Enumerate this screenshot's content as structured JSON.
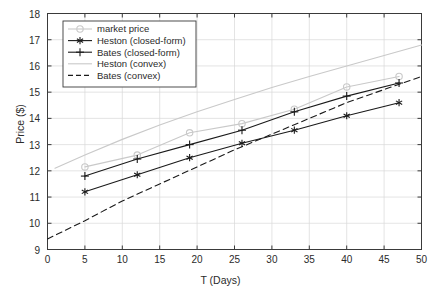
{
  "chart_data": {
    "type": "line",
    "title": "",
    "xlabel": "T (Days)",
    "ylabel": "Price ($)",
    "xlim": [
      0,
      50
    ],
    "ylim": [
      9,
      18
    ],
    "xticks": [
      0,
      5,
      10,
      15,
      20,
      25,
      30,
      35,
      40,
      45,
      50
    ],
    "yticks": [
      9,
      10,
      11,
      12,
      13,
      14,
      15,
      16,
      17,
      18
    ],
    "grid": true,
    "legend_position": "upper-left",
    "x": [
      5,
      12,
      19,
      26,
      33,
      40,
      47
    ],
    "series": [
      {
        "name": "market price",
        "label": "market price",
        "color": "#c9c9c9",
        "marker": "circle",
        "linestyle": "solid",
        "values": [
          12.15,
          12.6,
          13.45,
          13.8,
          14.35,
          15.2,
          15.6
        ]
      },
      {
        "name": "Heston (closed-form)",
        "label": "Heston (closed-form)",
        "color": "#1a1a1a",
        "marker": "asterisk",
        "linestyle": "solid",
        "values": [
          11.2,
          11.85,
          12.5,
          13.05,
          13.55,
          14.1,
          14.6
        ]
      },
      {
        "name": "Bates (closed-form)",
        "label": "Bates (closed-form)",
        "color": "#1a1a1a",
        "marker": "plus",
        "linestyle": "solid",
        "values": [
          11.8,
          12.45,
          13.0,
          13.55,
          14.25,
          14.85,
          15.35
        ]
      },
      {
        "name": "Heston (convex)",
        "label": "Heston (convex)",
        "color": "#c9c9c9",
        "marker": "none",
        "linestyle": "solid",
        "x": [
          1,
          5,
          10,
          15,
          20,
          25,
          30,
          35,
          40,
          45,
          50
        ],
        "values": [
          12.1,
          12.6,
          13.2,
          13.75,
          14.25,
          14.72,
          15.18,
          15.6,
          16.0,
          16.4,
          16.8
        ]
      },
      {
        "name": "Bates (convex)",
        "label": "Bates (convex)",
        "color": "#1a1a1a",
        "marker": "none",
        "linestyle": "dashed",
        "x": [
          0,
          5,
          10,
          15,
          20,
          25,
          30,
          35,
          40,
          45,
          50
        ],
        "values": [
          9.4,
          10.1,
          10.85,
          11.5,
          12.15,
          12.8,
          13.4,
          14.0,
          14.6,
          15.1,
          15.6
        ]
      }
    ]
  },
  "legend": {
    "items": [
      {
        "label": "market price"
      },
      {
        "label": "Heston (closed-form)"
      },
      {
        "label": "Bates (closed-form)"
      },
      {
        "label": "Heston (convex)"
      },
      {
        "label": "Bates (convex)"
      }
    ]
  },
  "axes": {
    "xlabel": "T (Days)",
    "ylabel": "Price ($)",
    "xticklabels": [
      "0",
      "5",
      "10",
      "15",
      "20",
      "25",
      "30",
      "35",
      "40",
      "45",
      "50"
    ],
    "yticklabels": [
      "9",
      "10",
      "11",
      "12",
      "13",
      "14",
      "15",
      "16",
      "17",
      "18"
    ]
  },
  "colors": {
    "light_gray": "#c9c9c9",
    "dark": "#1a1a1a",
    "axis": "#3a3a3a",
    "grid": "#d8d8d8"
  }
}
